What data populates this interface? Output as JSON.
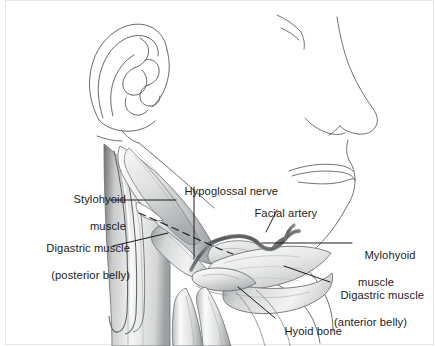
{
  "figure": {
    "style": "grayscale pen-and-ink medical illustration",
    "background_color": "#ffffff",
    "border_color": "#e3e3e3",
    "ink_color": "#2b2b2b",
    "leader_line_color": "#111111",
    "shading": {
      "lightest": "#fbfbfb",
      "light": "#eceded",
      "mid": "#c9cbcc",
      "dark": "#8d9092",
      "darkest": "#4a4d4f",
      "vessel": "#6e7173"
    }
  },
  "labels": [
    {
      "id": "stylohyoid",
      "name": "stylohyoid-muscle",
      "line1": "Stylohyoid",
      "line2": "muscle",
      "align": "right",
      "leader": "horizontal line running right from the label to the slender stylohyoid muscle belly"
    },
    {
      "id": "digastric_posterior",
      "name": "digastric-muscle-posterior-belly",
      "line1": "Digastric muscle",
      "line2": "(posterior belly)",
      "align": "right",
      "leader": "line angling up-right to the posterior belly of the digastric muscle"
    },
    {
      "id": "hypoglossal",
      "name": "hypoglossal-nerve",
      "line1": "Hypoglossal nerve",
      "line2": "",
      "align": "left",
      "leader": "vertical line dropping to the dashed nerve course beneath the mylohyoid"
    },
    {
      "id": "facial_artery",
      "name": "facial-artery",
      "line1": "Facial artery",
      "line2": "",
      "align": "left",
      "leader": "short line descending to the branching facial artery"
    },
    {
      "id": "mylohyoid",
      "name": "mylohyoid-muscle",
      "line1": "Mylohyoid",
      "line2": "muscle",
      "align": "left",
      "leader": "long horizontal line running left to the mylohyoid sheet"
    },
    {
      "id": "digastric_anterior",
      "name": "digastric-muscle-anterior-belly",
      "line1": "Digastric muscle",
      "line2": "(anterior belly)",
      "align": "left",
      "leader": "line running up-left to the anterior belly of the digastric muscle"
    },
    {
      "id": "hyoid_bone",
      "name": "hyoid-bone",
      "line1": "Hyoid bone",
      "line2": "",
      "align": "left",
      "leader": "line running up-left to the body of the hyoid bone"
    }
  ],
  "anatomy": {
    "surface_outline": [
      "ear-auricle",
      "mastoid-contour",
      "eye-lower-lid",
      "nose-profile",
      "upper-lip",
      "lower-lip",
      "chin-contour",
      "mandible-border",
      "neck-contour"
    ],
    "structures": [
      "posterior-belly-digastric",
      "anterior-belly-digastric",
      "stylohyoid-muscle",
      "mylohyoid-muscle",
      "hyoglossus-muscle",
      "hyoid-bone",
      "facial-artery",
      "hypoglossal-nerve",
      "carotid-sheath-vessels",
      "sternocleidomastoid-muscle",
      "omohyoid-muscle"
    ],
    "dashed_path": "hypoglossal nerve passing deep to the digastric tendon"
  }
}
